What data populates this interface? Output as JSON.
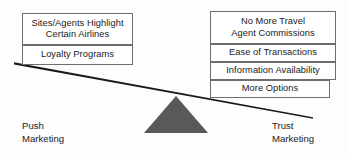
{
  "diagram": {
    "type": "seesaw-balance",
    "background_color": "#fdfdfd",
    "line_color": "#1a1a1a",
    "box_border_color": "#6e6e6e",
    "fulcrum_color": "#595959"
  },
  "left_side": {
    "caption": "Push\nMarketing",
    "boxes": [
      {
        "label": "Sites/Agents Highlight\nCertain Airlines"
      },
      {
        "label": "Loyalty Programs"
      }
    ]
  },
  "right_side": {
    "caption": "Trust\nMarketing",
    "boxes": [
      {
        "label": "No More Travel\nAgent Commissions"
      },
      {
        "label": "Ease of Transactions"
      },
      {
        "label": "Information Availability"
      },
      {
        "label": "More Options"
      }
    ]
  },
  "fulcrum": {
    "shape": "triangle",
    "apex_x": 176,
    "apex_y": 96,
    "base_left_x": 144,
    "base_right_x": 208,
    "base_y": 133
  },
  "beam": {
    "left_x": 14,
    "left_y": 63,
    "right_x": 313,
    "right_y": 118
  }
}
